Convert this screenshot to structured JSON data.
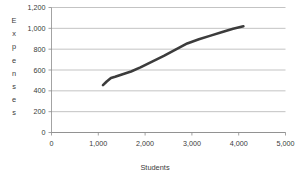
{
  "chart_data": {
    "type": "line",
    "title": "",
    "xlabel": "Students",
    "ylabel": "Expenses",
    "xlim": [
      0,
      5000
    ],
    "ylim": [
      0,
      1200
    ],
    "grid": true,
    "legend": null,
    "x_ticks": [
      0,
      1000,
      2000,
      3000,
      4000,
      5000
    ],
    "x_tick_labels": [
      "0",
      "1,000",
      "2,000",
      "3,000",
      "4,000",
      "5,000"
    ],
    "y_ticks": [
      0,
      200,
      400,
      600,
      800,
      1000,
      1200
    ],
    "y_tick_labels": [
      "0",
      "200",
      "400",
      "600",
      "800",
      "1,000",
      "1,200"
    ],
    "series": [
      {
        "name": "Expenses",
        "color": "#3c3c3c",
        "line_width": 2.6,
        "x": [
          1100,
          1180,
          1270,
          1360,
          1520,
          1700,
          1900,
          2150,
          2400,
          2650,
          2900,
          3150,
          3400,
          3650,
          3880,
          4100
        ],
        "values": [
          455,
          490,
          523,
          535,
          560,
          585,
          625,
          680,
          735,
          795,
          855,
          895,
          930,
          965,
          995,
          1020
        ]
      }
    ]
  },
  "axis": {
    "ylabel_letters": [
      "E",
      "x",
      "p",
      "e",
      "n",
      "s",
      "e",
      "s"
    ]
  },
  "colors": {
    "grid": "#b4b4b4",
    "axis": "#8c8c8c",
    "text": "#3a3a3a",
    "line": "#3c3c3c",
    "background": "#ffffff"
  }
}
